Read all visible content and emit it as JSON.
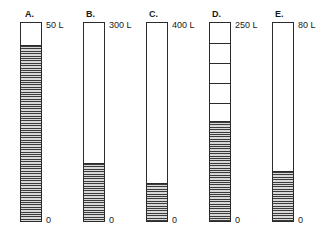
{
  "figure": {
    "zero_label": "0",
    "capacity_unit": "L",
    "stroke_color": "#2b2b2b",
    "fill_pattern": "hatched-horizontal-lines",
    "background": "#ffffff"
  },
  "cylinders": [
    {
      "letter": "A.",
      "capacity_label": "50 L",
      "capacity_value": 50,
      "zero_label": "0",
      "fill_percent": 88,
      "graduations": 0,
      "x": 20,
      "width": 22,
      "top": 22,
      "bottom": 222,
      "letter_x": 25,
      "letter_y": 9,
      "capacity_x": 46,
      "capacity_y": 20,
      "zero_x": 46,
      "zero_y": 215
    },
    {
      "letter": "B.",
      "capacity_label": "300 L",
      "capacity_value": 300,
      "zero_label": "0",
      "fill_percent": 29,
      "graduations": 0,
      "x": 83,
      "width": 22,
      "top": 22,
      "bottom": 222,
      "letter_x": 86,
      "letter_y": 9,
      "capacity_x": 109,
      "capacity_y": 20,
      "zero_x": 109,
      "zero_y": 215
    },
    {
      "letter": "C.",
      "capacity_label": "400 L",
      "capacity_value": 400,
      "zero_label": "0",
      "fill_percent": 19,
      "graduations": 0,
      "x": 146,
      "width": 22,
      "top": 22,
      "bottom": 222,
      "letter_x": 149,
      "letter_y": 9,
      "capacity_x": 172,
      "capacity_y": 20,
      "zero_x": 172,
      "zero_y": 215
    },
    {
      "letter": "D.",
      "capacity_label": "250 L",
      "capacity_value": 250,
      "zero_label": "0",
      "fill_percent": 50,
      "graduations": 5,
      "x": 209,
      "width": 22,
      "top": 22,
      "bottom": 222,
      "letter_x": 212,
      "letter_y": 9,
      "capacity_x": 235,
      "capacity_y": 20,
      "zero_x": 235,
      "zero_y": 215
    },
    {
      "letter": "E.",
      "capacity_label": "80 L",
      "capacity_value": 80,
      "zero_label": "0",
      "fill_percent": 25,
      "graduations": 0,
      "x": 272,
      "width": 22,
      "top": 22,
      "bottom": 222,
      "letter_x": 275,
      "letter_y": 9,
      "capacity_x": 298,
      "capacity_y": 20,
      "zero_x": 298,
      "zero_y": 215
    }
  ]
}
